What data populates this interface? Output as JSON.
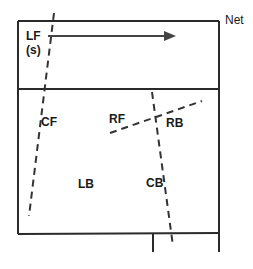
{
  "diagram": {
    "net_label": "Net",
    "players": [
      {
        "id": "LF",
        "label": "LF",
        "sub": "(s)",
        "x": 26,
        "y": 30
      },
      {
        "id": "CF",
        "label": "CF",
        "x": 41,
        "y": 121
      },
      {
        "id": "RF",
        "label": "RF",
        "x": 109,
        "y": 113
      },
      {
        "id": "RB",
        "label": "RB",
        "x": 166,
        "y": 117
      },
      {
        "id": "LB",
        "label": "LB",
        "x": 78,
        "y": 178
      },
      {
        "id": "CB",
        "label": "CB",
        "x": 146,
        "y": 177
      }
    ],
    "colors": {
      "line": "#2a2a2a",
      "arrow": "#444444"
    }
  }
}
